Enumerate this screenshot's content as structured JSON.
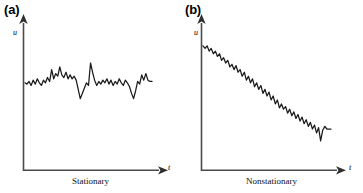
{
  "figure": {
    "background_color": "#ffffff",
    "line_color": "#1a1a1a",
    "axis_color": "#3a3a3a"
  },
  "panels": [
    {
      "tag": "(a)",
      "caption": "Stationary",
      "y_axis_label": "u",
      "x_axis_label": "t"
    },
    {
      "tag": "(b)",
      "caption": "Nonstationary",
      "y_axis_label": "u",
      "x_axis_label": "t"
    }
  ],
  "chart_data": [
    {
      "type": "line",
      "title": "Stationary",
      "xlabel": "t",
      "ylabel": "u",
      "grid": false,
      "legend": "none",
      "xlim": [
        0,
        100
      ],
      "ylim": [
        0,
        100
      ],
      "x": [
        0,
        1.6,
        3.2,
        4.8,
        6.4,
        8.1,
        9.7,
        11.3,
        12.9,
        14.5,
        16.1,
        17.7,
        19.4,
        21.0,
        22.6,
        24.2,
        25.8,
        27.4,
        29.0,
        30.6,
        32.3,
        33.9,
        35.5,
        37.1,
        38.7,
        40.3,
        41.9,
        43.5,
        45.2,
        46.8,
        48.4,
        50.0,
        51.6,
        53.2,
        54.8,
        56.5,
        58.1,
        59.7,
        61.3,
        62.9,
        64.5,
        66.1,
        67.7,
        69.4,
        71.0,
        72.6,
        74.2,
        75.8,
        77.4,
        79.0,
        80.6,
        82.3,
        83.9,
        85.5,
        87.1,
        88.7,
        90.3,
        91.9,
        93.5,
        95.2,
        96.8,
        98.4,
        100.0
      ],
      "y": [
        60,
        59,
        61,
        58,
        62,
        59,
        63,
        60,
        58,
        62,
        60,
        64,
        61,
        70,
        63,
        67,
        65,
        72,
        66,
        64,
        68,
        63,
        66,
        63,
        65,
        62,
        55,
        48,
        52,
        56,
        60,
        58,
        75,
        68,
        62,
        58,
        61,
        59,
        62,
        60,
        63,
        59,
        62,
        58,
        61,
        59,
        63,
        60,
        58,
        62,
        60,
        57,
        52,
        48,
        54,
        61,
        59,
        66,
        62,
        67,
        62,
        61,
        61
      ],
      "note": "Random fluctuation about a constant mean level; amplitude and mean do not change with t"
    },
    {
      "type": "line",
      "title": "Nonstationary",
      "xlabel": "t",
      "ylabel": "u",
      "grid": false,
      "legend": "none",
      "xlim": [
        0,
        100
      ],
      "ylim": [
        0,
        100
      ],
      "x": [
        0,
        1.6,
        3.2,
        4.8,
        6.4,
        8.1,
        9.7,
        11.3,
        12.9,
        14.5,
        16.1,
        17.7,
        19.4,
        21.0,
        22.6,
        24.2,
        25.8,
        27.4,
        29.0,
        30.6,
        32.3,
        33.9,
        35.5,
        37.1,
        38.7,
        40.3,
        41.9,
        43.5,
        45.2,
        46.8,
        48.4,
        50.0,
        51.6,
        53.2,
        54.8,
        56.5,
        58.1,
        59.7,
        61.3,
        62.9,
        64.5,
        66.1,
        67.7,
        69.4,
        71.0,
        72.6,
        74.2,
        75.8,
        77.4,
        79.0,
        80.6,
        82.3,
        83.9,
        85.5,
        87.1,
        88.7,
        90.3,
        91.9,
        93.5,
        95.2,
        96.8,
        98.4,
        100.0
      ],
      "y": [
        88,
        86,
        88,
        84,
        86,
        82,
        84,
        80,
        82,
        77,
        79,
        75,
        77,
        72,
        74,
        70,
        73,
        68,
        70,
        65,
        68,
        62,
        65,
        60,
        63,
        57,
        60,
        55,
        58,
        52,
        55,
        50,
        53,
        47,
        50,
        44,
        47,
        41,
        44,
        40,
        42,
        37,
        40,
        35,
        38,
        33,
        36,
        31,
        34,
        29,
        32,
        27,
        30,
        25,
        28,
        22,
        26,
        16,
        24,
        27,
        25,
        25,
        25
      ],
      "note": "Mean level decreases steadily with t; trend superposed on random fluctuation"
    }
  ]
}
